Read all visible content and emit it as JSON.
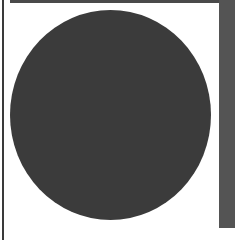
{
  "shapes": {
    "circle": {
      "color": "#3b3b3b",
      "shape": "filled-ellipse"
    },
    "top_bar": {
      "color": "#4a4a4a"
    },
    "right_bar": {
      "color": "#545454"
    },
    "left_border": {
      "color": "#3a3a3a"
    },
    "background": {
      "color": "#ffffff"
    }
  }
}
